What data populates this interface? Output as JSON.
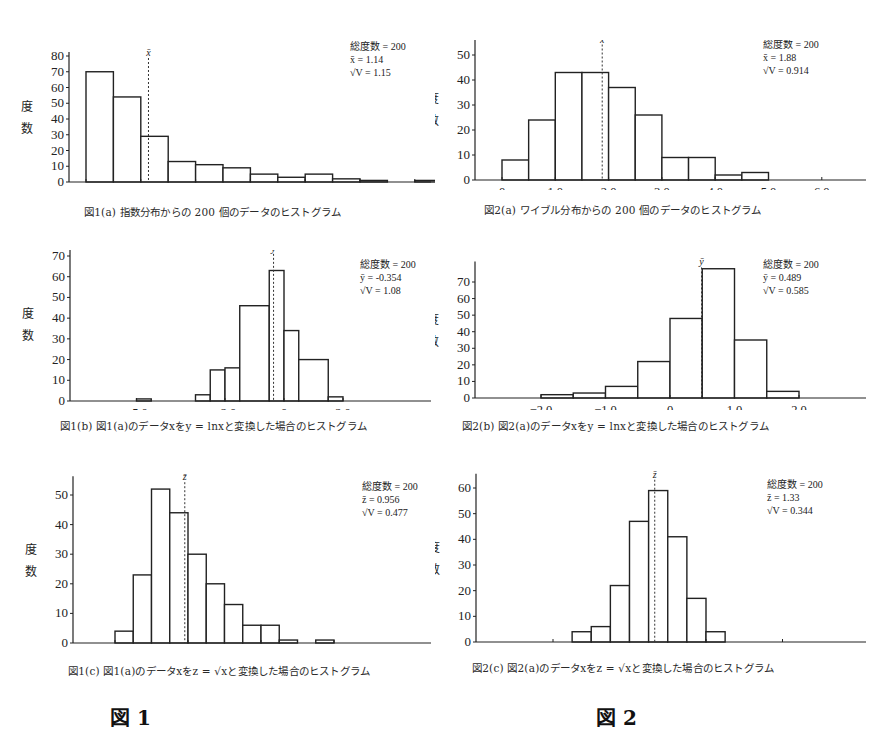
{
  "figure_labels": {
    "fig1": "図 1",
    "fig2": "図 2"
  },
  "ylabel_chars": [
    "度",
    "数"
  ],
  "chart_data": [
    {
      "id": "1a",
      "type": "bar",
      "title": "図1(a) 指数分布からの 200 個のデータのヒストグラム",
      "xlabel": "",
      "ylabel": "度数",
      "bin_start": 0.0,
      "bin_width": 0.5,
      "values": [
        70,
        54,
        29,
        13,
        11,
        9,
        5,
        3,
        5,
        2,
        1,
        0,
        1
      ],
      "xticks": [
        0,
        1.0,
        2.0,
        3.0,
        4.0,
        5.0,
        6.0
      ],
      "xtick_labels": [
        "0",
        "1.0",
        "2.0",
        "3.0",
        "4.0",
        "5.0",
        "6.0"
      ],
      "yticks": [
        0,
        10,
        20,
        30,
        40,
        50,
        60,
        70,
        80
      ],
      "ylim": [
        0,
        80
      ],
      "xlim": [
        -0.3,
        6.6
      ],
      "mean_line": 1.14,
      "mean_symbol": "x̄",
      "stats": [
        "総度数 = 200",
        "x̄ = 1.14",
        "√V = 1.15"
      ]
    },
    {
      "id": "2a",
      "type": "bar",
      "title": "図2(a) ワイブル分布からの 200 個のデータのヒストグラム",
      "xlabel": "",
      "ylabel": "度数",
      "bin_start": 0.0,
      "bin_width": 0.5,
      "values": [
        8,
        24,
        43,
        43,
        37,
        26,
        9,
        9,
        2,
        3
      ],
      "xticks": [
        0,
        1.0,
        2.0,
        3.0,
        4.0,
        5.0,
        6.0
      ],
      "xtick_labels": [
        "0",
        "1.0",
        "2.0",
        "3.0",
        "4.0",
        "5.0",
        "6.0"
      ],
      "yticks": [
        0,
        10,
        20,
        30,
        40,
        50
      ],
      "ylim": [
        0,
        55
      ],
      "xlim": [
        -0.6,
        6.3
      ],
      "mean_line": 1.88,
      "mean_symbol": "x̄",
      "stats": [
        "総度数 = 200",
        "x̄ = 1.88",
        "√V = 0.914"
      ]
    },
    {
      "id": "1b",
      "type": "bar",
      "title": "図1(b) 図1(a)のデータxをy = lnxと変換した場合のヒストグラム",
      "xlabel": "",
      "ylabel": "度数",
      "bins": [
        {
          "x0": -5.0,
          "x1": -4.5,
          "v": 1
        },
        {
          "x0": -3.0,
          "x1": -2.5,
          "v": 3
        },
        {
          "x0": -2.5,
          "x1": -2.0,
          "v": 15
        },
        {
          "x0": -2.0,
          "x1": -1.5,
          "v": 16
        },
        {
          "x0": -1.5,
          "x1": -0.5,
          "v": 46
        },
        {
          "x0": -0.5,
          "x1": 0.0,
          "v": 63
        },
        {
          "x0": 0.0,
          "x1": 0.5,
          "v": 34
        },
        {
          "x0": 0.5,
          "x1": 1.5,
          "v": 20
        },
        {
          "x0": 1.5,
          "x1": 2.0,
          "v": 2
        }
      ],
      "xticks": [
        -5.0,
        -2.0,
        0,
        2.0
      ],
      "xtick_labels": [
        "-5.0",
        "-2.0",
        "0",
        "2.0"
      ],
      "yticks": [
        0,
        10,
        20,
        30,
        40,
        50,
        60,
        70
      ],
      "ylim": [
        0,
        72
      ],
      "xlim": [
        -7.0,
        4.2
      ],
      "mean_line": -0.354,
      "mean_symbol": "ȳ",
      "stats": [
        "総度数 = 200",
        "ȳ = -0.354",
        "√V = 1.08"
      ]
    },
    {
      "id": "2b",
      "type": "bar",
      "title": "図2(b) 図2(a)のデータxをy = lnxと変換した場合のヒストグラム",
      "xlabel": "",
      "ylabel": "度数",
      "bin_start": -2.0,
      "bin_width": 0.5,
      "values": [
        2,
        3,
        7,
        22,
        48,
        78,
        35,
        4
      ],
      "xticks": [
        -2.0,
        -1.0,
        0,
        1.0,
        2.0
      ],
      "xtick_labels": [
        "-2.0",
        "-1.0",
        "0",
        "1.0",
        "2.0"
      ],
      "yticks": [
        0,
        10,
        20,
        30,
        40,
        50,
        60,
        70
      ],
      "ylim": [
        0,
        80
      ],
      "xlim": [
        -3.0,
        2.6
      ],
      "mean_line": 0.489,
      "mean_symbol": "ȳ",
      "stats": [
        "総度数 = 200",
        "ȳ = 0.489",
        "√V = 0.585"
      ]
    },
    {
      "id": "1c",
      "type": "bar",
      "title": "図1(c) 図1(a)のデータxをz = √xと変換した場合のヒストグラム",
      "xlabel": "",
      "ylabel": "度数",
      "bin_start": 0.0,
      "bin_width": 0.25,
      "values": [
        4,
        23,
        52,
        44,
        30,
        20,
        13,
        6,
        6,
        1,
        0,
        1
      ],
      "xticks": [
        0,
        1.0,
        2.0,
        3.0
      ],
      "xtick_labels": [
        "0",
        "1.0",
        "2.0",
        "3.0"
      ],
      "yticks": [
        0,
        10,
        20,
        30,
        40,
        50
      ],
      "ylim": [
        0,
        55
      ],
      "xlim": [
        -0.6,
        4.2
      ],
      "mean_line": 0.956,
      "mean_symbol": "z̄",
      "stats": [
        "総度数 = 200",
        "z̄ = 0.956",
        "√V = 0.477"
      ]
    },
    {
      "id": "2c",
      "type": "bar",
      "title": "図2(c) 図2(a)のデータxをz = √xと変換した場合のヒストグラム",
      "xlabel": "",
      "ylabel": "度数",
      "bin_start": 0.25,
      "bin_width": 0.25,
      "values": [
        4,
        6,
        22,
        47,
        59,
        41,
        17,
        4
      ],
      "xticks": [
        0,
        1.0,
        2.0,
        3.0
      ],
      "xtick_labels": [
        "0",
        "1.0",
        "2.0",
        "3.0"
      ],
      "yticks": [
        0,
        10,
        20,
        30,
        40,
        50,
        60
      ],
      "ylim": [
        0,
        64
      ],
      "xlim": [
        -1.0,
        3.6
      ],
      "mean_line": 1.33,
      "mean_symbol": "z̄",
      "stats": [
        "総度数 = 200",
        "z̄ = 1.33",
        "√V = 0.344"
      ]
    }
  ]
}
